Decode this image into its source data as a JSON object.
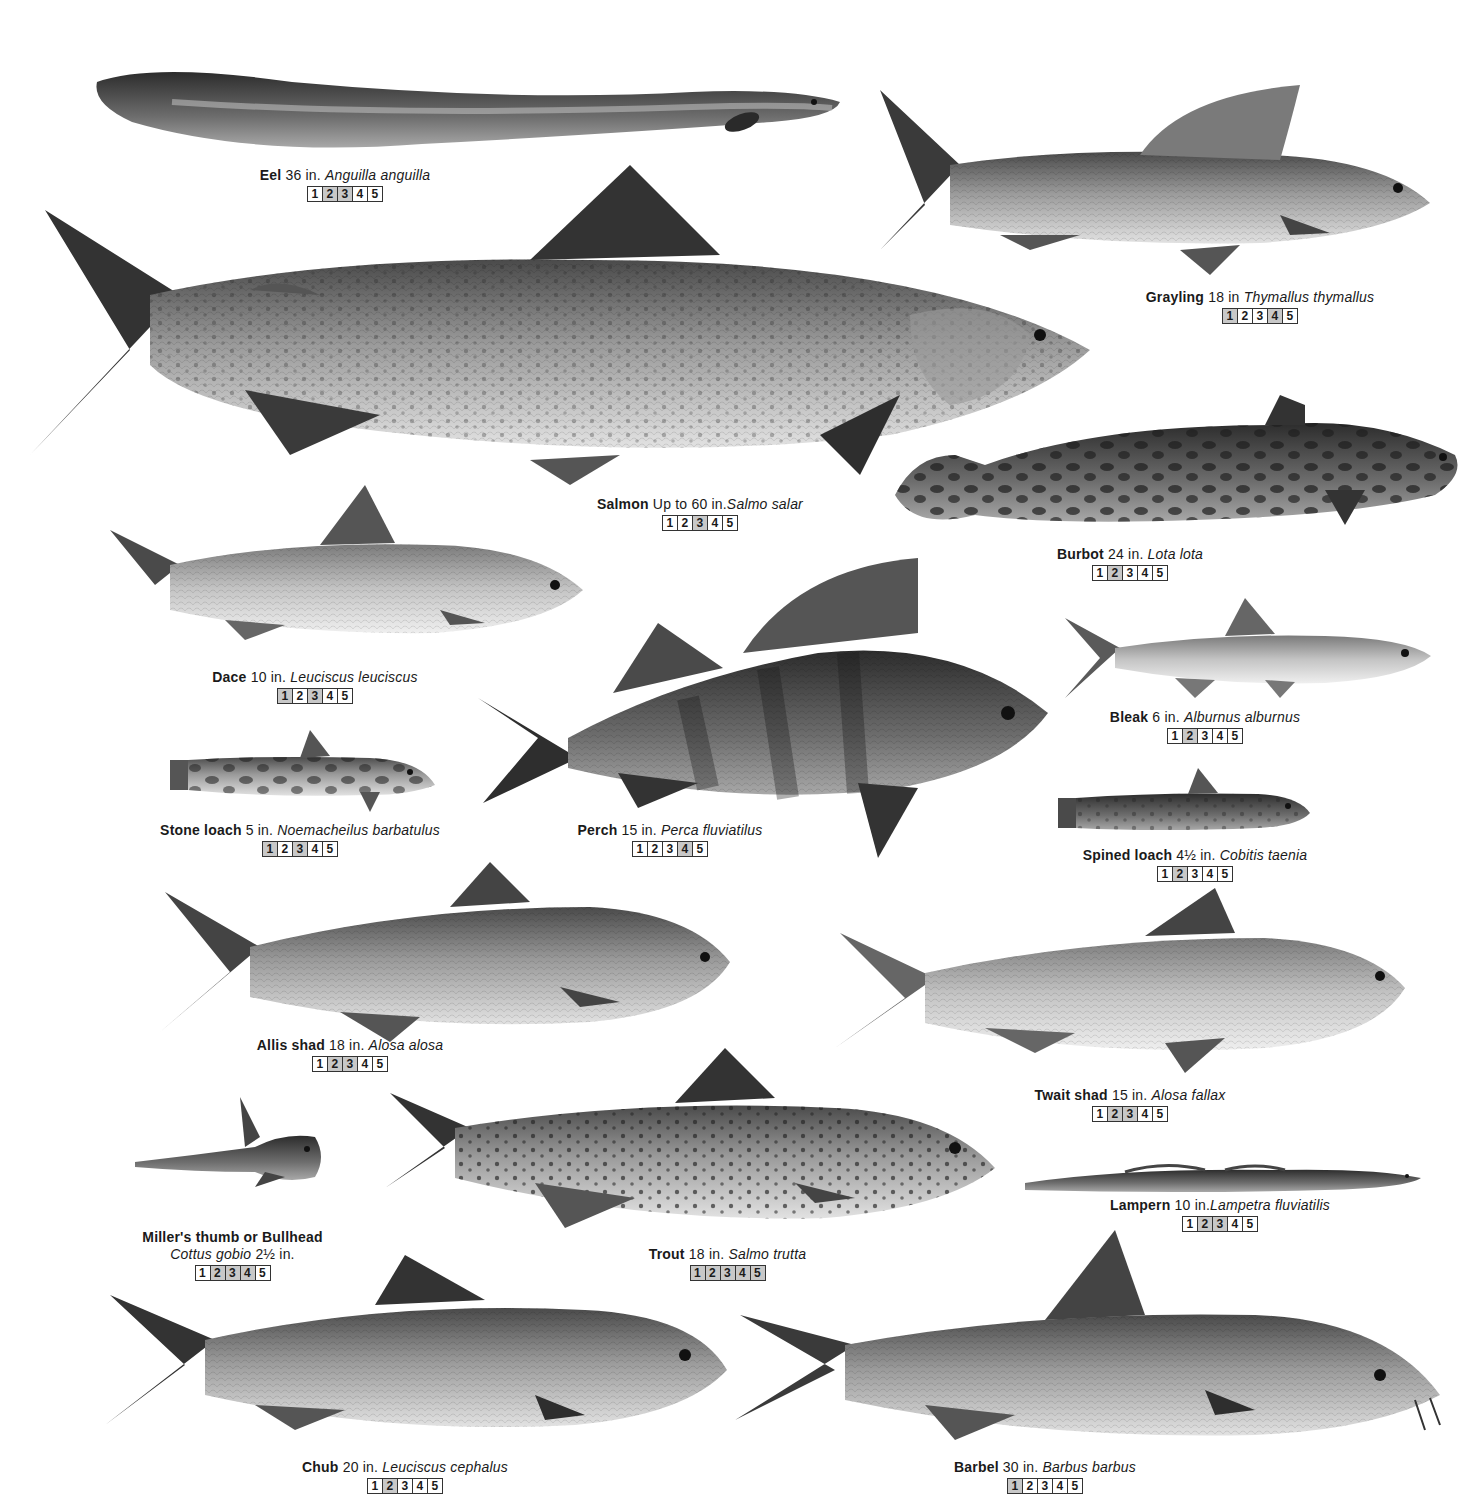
{
  "plate": {
    "fish": [
      {
        "id": "eel",
        "common": "Eel",
        "size": "36 in.",
        "latin": "Anguilla anguilla",
        "boxes": [
          "1",
          "2",
          "3",
          "4",
          "5"
        ]
      },
      {
        "id": "grayling",
        "common": "Grayling",
        "size": "18 in",
        "latin": "Thymallus thymallus",
        "boxes": [
          "1",
          "2",
          "3",
          "4",
          "5"
        ]
      },
      {
        "id": "salmon",
        "common": "Salmon",
        "size": "Up to 60 in.",
        "latin": "Salmo salar",
        "boxes": [
          "1",
          "2",
          "3",
          "4",
          "5"
        ]
      },
      {
        "id": "burbot",
        "common": "Burbot",
        "size": "24 in.",
        "latin": "Lota lota",
        "boxes": [
          "1",
          "2",
          "3",
          "4",
          "5"
        ]
      },
      {
        "id": "dace",
        "common": "Dace",
        "size": "10 in.",
        "latin": "Leuciscus leuciscus",
        "boxes": [
          "1",
          "2",
          "3",
          "4",
          "5"
        ]
      },
      {
        "id": "bleak",
        "common": "Bleak",
        "size": "6 in.",
        "latin": "Alburnus alburnus",
        "boxes": [
          "1",
          "2",
          "3",
          "4",
          "5"
        ]
      },
      {
        "id": "perch",
        "common": "Perch",
        "size": "15 in.",
        "latin": "Perca fluviatilus",
        "boxes": [
          "1",
          "2",
          "3",
          "4",
          "5"
        ]
      },
      {
        "id": "stone_loach",
        "common": "Stone loach",
        "size": "5 in.",
        "latin": "Noemacheilus barbatulus",
        "boxes": [
          "1",
          "2",
          "3",
          "4",
          "5"
        ]
      },
      {
        "id": "spined_loach",
        "common": "Spined loach",
        "size": "4½ in.",
        "latin": "Cobitis taenia",
        "boxes": [
          "1",
          "2",
          "3",
          "4",
          "5"
        ]
      },
      {
        "id": "allis_shad",
        "common": "Allis shad",
        "size": "18 in.",
        "latin": "Alosa alosa",
        "boxes": [
          "1",
          "2",
          "3",
          "4",
          "5"
        ]
      },
      {
        "id": "twait_shad",
        "common": "Twait shad",
        "size": "15 in.",
        "latin": "Alosa fallax",
        "boxes": [
          "1",
          "2",
          "3",
          "4",
          "5"
        ]
      },
      {
        "id": "lampern",
        "common": "Lampern",
        "size": "10 in.",
        "latin": "Lampetra fluviatilis",
        "boxes": [
          "1",
          "2",
          "3",
          "4",
          "5"
        ]
      },
      {
        "id": "bullhead",
        "common": "Miller's thumb or Bullhead",
        "size": "2½ in.",
        "latin": "Cottus gobio",
        "boxes": [
          "1",
          "2",
          "3",
          "4",
          "5"
        ]
      },
      {
        "id": "trout",
        "common": "Trout",
        "size": "18 in.",
        "latin": "Salmo trutta",
        "boxes": [
          "1",
          "2",
          "3",
          "4",
          "5"
        ]
      },
      {
        "id": "chub",
        "common": "Chub",
        "size": "20 in.",
        "latin": "Leuciscus cephalus",
        "boxes": [
          "1",
          "2",
          "3",
          "4",
          "5"
        ]
      },
      {
        "id": "barbel",
        "common": "Barbel",
        "size": "30 in.",
        "latin": "Barbus barbus",
        "boxes": [
          "1",
          "2",
          "3",
          "4",
          "5"
        ]
      }
    ]
  },
  "colors": {
    "background": "#ffffff",
    "text": "#1a1a1a",
    "fish_dark": "#3a3a3a",
    "fish_mid": "#8a8a8a",
    "fish_light": "#d6d6d6"
  }
}
